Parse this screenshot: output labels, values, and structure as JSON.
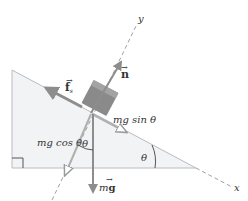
{
  "diagram": {
    "colors": {
      "incline_fill": "#f2f3f5",
      "incline_edge": "#b8bcc2",
      "block": "#8a8a8a",
      "arrow": "#8d8d8d",
      "axis": "#a0a0a0",
      "text": "#333333"
    },
    "axes": {
      "x_label": "x",
      "y_label": "y"
    },
    "forces": {
      "normal": {
        "symbol": "n",
        "label": "n"
      },
      "friction": {
        "symbol": "f",
        "subscript": "s",
        "label": "f"
      },
      "gravity": {
        "symbol": "g",
        "prefix": "m",
        "label": "mg"
      },
      "gravity_parallel": {
        "label": "mg sin θ"
      },
      "gravity_perpendicular": {
        "label": "mg cos θ"
      }
    },
    "angles": {
      "incline_angle": "θ",
      "gravity_angle": "θ"
    }
  }
}
